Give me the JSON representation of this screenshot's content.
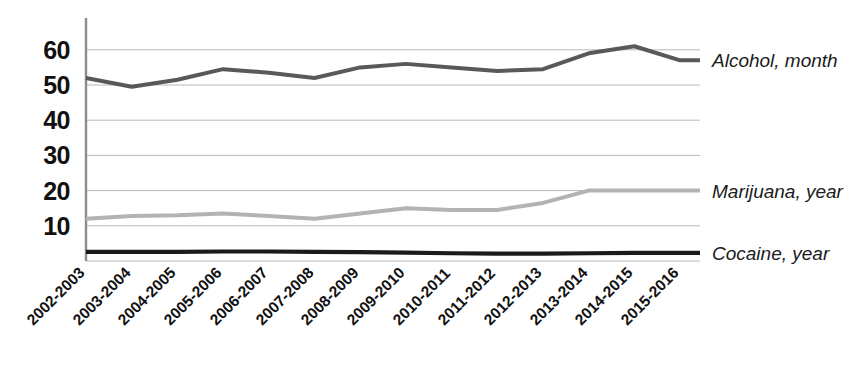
{
  "chart_data": {
    "type": "line",
    "title": "",
    "xlabel": "",
    "ylabel": "",
    "categories": [
      "2002-2003",
      "2003-2004",
      "2004-2005",
      "2005-2006",
      "2006-2007",
      "2007-2008",
      "2008-2009",
      "2009-2010",
      "2010-2011",
      "2011-2012",
      "2012-2013",
      "2013-2014",
      "2014-2015",
      "2015-2016"
    ],
    "series": [
      {
        "name": "Alcohol, month",
        "color": "#595959",
        "values": [
          52,
          49.5,
          51.5,
          54.5,
          53.5,
          52,
          55,
          56,
          55,
          54,
          54.5,
          59,
          61,
          57
        ]
      },
      {
        "name": "Marijuana, year",
        "color": "#b3b3b3",
        "values": [
          12,
          12.8,
          13,
          13.5,
          12.8,
          12,
          13.5,
          15,
          14.5,
          14.5,
          16.5,
          20,
          20,
          20
        ]
      },
      {
        "name": "Cocaine, year",
        "color": "#1a1a1a",
        "values": [
          2.6,
          2.6,
          2.6,
          2.7,
          2.7,
          2.6,
          2.5,
          2.4,
          2.2,
          2.1,
          2.1,
          2.2,
          2.3,
          2.3
        ]
      }
    ],
    "yticks": [
      10,
      20,
      30,
      40,
      50,
      60
    ],
    "ylim": [
      0,
      66
    ],
    "grid": true,
    "grid_color": "#b9b9b9",
    "axis_color": "#8c8c8c",
    "legend_position": "right-inline"
  },
  "y_axis": {
    "ticks": [
      "60",
      "50",
      "40",
      "30",
      "20",
      "10"
    ]
  },
  "x_axis": {
    "ticks": [
      "2002-2003",
      "2003-2004",
      "2004-2005",
      "2005-2006",
      "2006-2007",
      "2007-2008",
      "2008-2009",
      "2009-2010",
      "2010-2011",
      "2011-2012",
      "2012-2013",
      "2013-2014",
      "2014-2015",
      "2015-2016"
    ]
  },
  "legend": {
    "entries": [
      {
        "label": "Alcohol, month"
      },
      {
        "label": "Marijuana, year"
      },
      {
        "label": "Cocaine, year"
      }
    ]
  }
}
